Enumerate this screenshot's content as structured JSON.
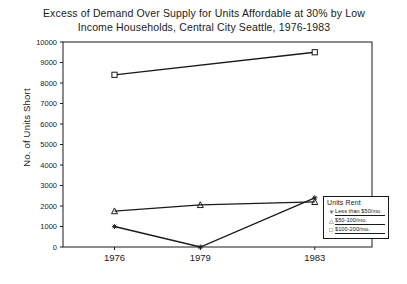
{
  "chart_data": {
    "type": "line",
    "title": "Excess of Demand Over Supply for Units Affordable at 30% by Low\nIncome Households, Central City Seattle, 1976-1983",
    "xlabel": "",
    "ylabel": "No. of Units Short",
    "categories": [
      "1976",
      "1979",
      "1983"
    ],
    "x": [
      1976,
      1979,
      1983
    ],
    "xlim": [
      1974.2,
      1985.0
    ],
    "ylim": [
      0,
      10000
    ],
    "yticks": [
      "0",
      "1000",
      "2000",
      "3000",
      "4000",
      "5000",
      "6000",
      "7000",
      "8000",
      "9000",
      "10000"
    ],
    "ytick_values": [
      0,
      1000,
      2000,
      3000,
      4000,
      5000,
      6000,
      7000,
      8000,
      9000,
      10000
    ],
    "grid": false,
    "legend_position": "lower-right",
    "legend_title": "Units Rent",
    "series": [
      {
        "name": "Less than $50/mo.",
        "marker": "asterisk",
        "x": [
          1976,
          1979,
          1983
        ],
        "values": [
          1000,
          0,
          2400
        ]
      },
      {
        "name": "$50-100/mo.",
        "marker": "triangle",
        "x": [
          1976,
          1979,
          1983
        ],
        "values": [
          1750,
          2050,
          2200
        ]
      },
      {
        "name": "$100-200/mo.",
        "marker": "square",
        "x": [
          1976,
          1983
        ],
        "values": [
          8400,
          9500
        ]
      }
    ]
  },
  "legend": {
    "title": "Units Rent",
    "items": [
      {
        "marker": "asterisk",
        "label": "Less than $50/mo."
      },
      {
        "marker": "triangle",
        "label": "$50-100/mo."
      },
      {
        "marker": "square",
        "label": "$100-200/mo."
      }
    ]
  }
}
